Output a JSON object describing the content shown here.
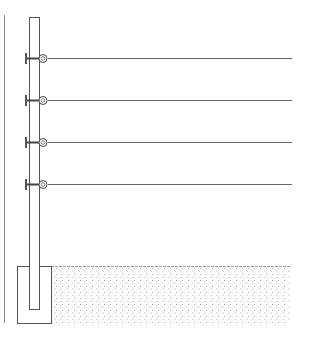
{
  "diagram": {
    "colors": {
      "line": "#555555",
      "wire": "#666666",
      "soil": "#9a9a9a",
      "background": "#ffffff"
    },
    "post": {
      "x": 29,
      "y": 17,
      "width": 10,
      "bottom": 310
    },
    "footing": {
      "x": 17,
      "y": 266,
      "width": 34,
      "height": 57
    },
    "ground": {
      "x": 51,
      "y": 266,
      "width": 239,
      "height": 57
    },
    "border_line_x": 4,
    "wires": [
      {
        "y": 58,
        "x_end": 292
      },
      {
        "y": 100,
        "x_end": 292
      },
      {
        "y": 142,
        "x_end": 292
      },
      {
        "y": 184,
        "x_end": 292
      }
    ]
  }
}
